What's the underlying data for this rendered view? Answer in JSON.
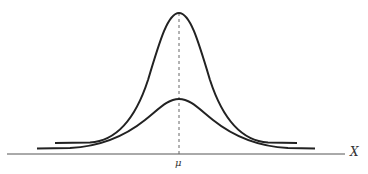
{
  "diagram": {
    "axis_label": "X",
    "mean_label": "μ",
    "curves": [
      {
        "name": "narrow-curve",
        "sigma": "small",
        "peak_height": "tall"
      },
      {
        "name": "wide-curve",
        "sigma": "large",
        "peak_height": "short"
      }
    ],
    "colors": {
      "curve": "#222222",
      "axis": "#555555",
      "mean_line": "#666666"
    }
  }
}
